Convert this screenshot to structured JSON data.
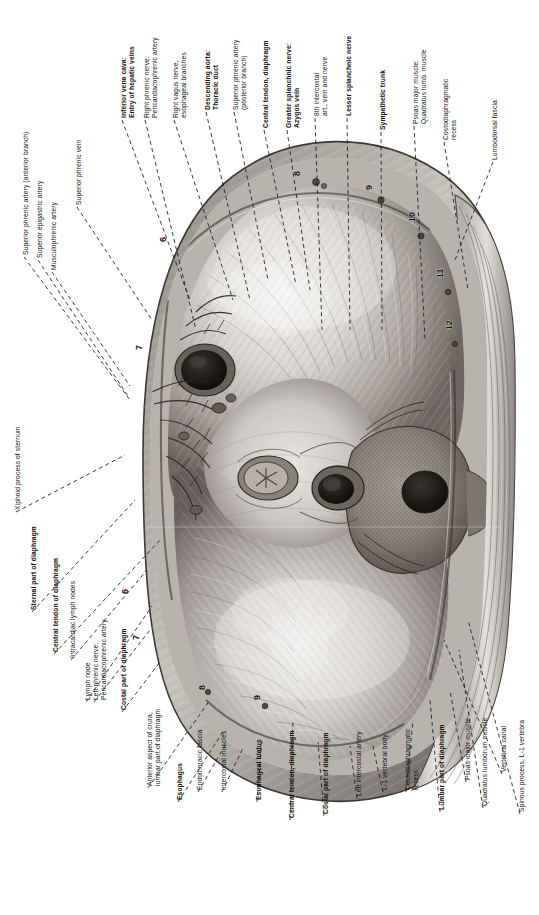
{
  "plate": {
    "title": "Diaphragm, inferior (abdominal) surface",
    "orientation": "rotated-90",
    "background_color": "#ffffff",
    "text_color": "#111111",
    "leader_line_color": "#1a1a1a"
  },
  "labels": {
    "top_row": [
      {
        "id": "inferior-vena-cava",
        "bold": true,
        "lines": [
          "Inferior vena cava:",
          "Entry of hepatic veins"
        ],
        "x": 120,
        "y": 118,
        "tip_x": 190,
        "tip_y": 300
      },
      {
        "id": "right-phrenic-nerve",
        "bold": false,
        "lines": [
          "Right phrenic nerve:",
          "Pericardiacophrenic artery"
        ],
        "x": 143,
        "y": 118,
        "tip_x": 196,
        "tip_y": 330
      },
      {
        "id": "right-vagus-nerve",
        "bold": false,
        "lines": [
          "Right vagus nerve,",
          "esophageal branches"
        ],
        "x": 172,
        "y": 118,
        "tip_x": 233,
        "tip_y": 300
      },
      {
        "id": "descending-aorta",
        "bold": true,
        "lines": [
          "Descending aorta:",
          "Thoracic duct"
        ],
        "x": 204,
        "y": 110,
        "tip_x": 250,
        "tip_y": 300
      },
      {
        "id": "superior-phrenic-artery",
        "bold": false,
        "lines": [
          "Superior phrenic artery",
          "(posterior branch)"
        ],
        "x": 232,
        "y": 110,
        "tip_x": 268,
        "tip_y": 280
      },
      {
        "id": "central-tendon-diaphragm-top",
        "bold": true,
        "lines": [
          "Central tendon, diaphragm"
        ],
        "x": 262,
        "y": 128,
        "tip_x": 296,
        "tip_y": 285
      },
      {
        "id": "greater-splanchnic-nerve",
        "bold": true,
        "lines": [
          "Greater splanchnic nerve:",
          "Azygos vein"
        ],
        "x": 285,
        "y": 128,
        "tip_x": 310,
        "tip_y": 290
      },
      {
        "id": "eighth-intercostal",
        "bold": false,
        "lines": [
          "8th intercostal",
          "art., vein and nerve"
        ],
        "x": 313,
        "y": 116,
        "tip_x": 322,
        "tip_y": 330
      },
      {
        "id": "lesser-splanchnic-nerve",
        "bold": true,
        "lines": [
          "Lesser splanchnic nerve"
        ],
        "x": 345,
        "y": 116,
        "tip_x": 350,
        "tip_y": 330
      },
      {
        "id": "sympathetic-trunk",
        "bold": true,
        "lines": [
          "Sympathetic trunk"
        ],
        "x": 379,
        "y": 130,
        "tip_x": 382,
        "tip_y": 330
      },
      {
        "id": "psoas-major-muscle-top",
        "bold": false,
        "lines": [
          "Psoas major muscle:",
          "Quadratus lumb. muscle"
        ],
        "x": 412,
        "y": 124,
        "tip_x": 425,
        "tip_y": 340
      },
      {
        "id": "costodiaphragmatic-recess-top",
        "bold": false,
        "lines": [
          "Costodiaphragmatic",
          "recess"
        ],
        "x": 442,
        "y": 140,
        "tip_x": 468,
        "tip_y": 290
      },
      {
        "id": "lumbodorsal-fascia",
        "bold": false,
        "lines": [
          "Lumbodorsal fascia"
        ],
        "x": 491,
        "y": 160,
        "tip_x": 455,
        "tip_y": 260
      }
    ],
    "left_column": [
      {
        "id": "superior-phrenic-artery-anterior",
        "bold": false,
        "lines": [
          "Superior phrenic artery (anterior branch)"
        ],
        "x": 22,
        "y": 255,
        "tip_x": 130,
        "tip_y": 400
      },
      {
        "id": "superior-epigastric-artery",
        "bold": false,
        "lines": [
          "Superior epigastric artery"
        ],
        "x": 36,
        "y": 258,
        "tip_x": 128,
        "tip_y": 396
      },
      {
        "id": "musculophrenic-artery",
        "bold": false,
        "lines": [
          "Musculophrenic artery"
        ],
        "x": 50,
        "y": 270,
        "tip_x": 130,
        "tip_y": 386
      },
      {
        "id": "superior-phrenic-vein",
        "bold": false,
        "lines": [
          "Superior phrenic vein"
        ],
        "x": 75,
        "y": 205,
        "tip_x": 152,
        "tip_y": 320
      },
      {
        "id": "xiphoid-process-of-sternum",
        "bold": false,
        "lines": [
          "Xiphoid process of sternum"
        ],
        "x": 14,
        "y": 510,
        "tip_x": 125,
        "tip_y": 455
      },
      {
        "id": "sternal-part-of-diaphragm",
        "bold": true,
        "lines": [
          "Sternal part of diaphragm"
        ],
        "x": 30,
        "y": 610,
        "tip_x": 135,
        "tip_y": 500
      },
      {
        "id": "central-tendon-of-diaphragm",
        "bold": true,
        "lines": [
          "Central tendon of diaphragm"
        ],
        "x": 52,
        "y": 652,
        "tip_x": 160,
        "tip_y": 540
      },
      {
        "id": "intracardiac-lymph-nodes",
        "bold": false,
        "lines": [
          "Intracardiac lymph nodes"
        ],
        "x": 69,
        "y": 658,
        "tip_x": 147,
        "tip_y": 570
      },
      {
        "id": "lymph-node",
        "bold": false,
        "lines": [
          "Lymph node"
        ],
        "x": 84,
        "y": 700,
        "tip_x": 152,
        "tip_y": 606
      },
      {
        "id": "left-phrenic-nerve",
        "bold": false,
        "lines": [
          "Left phrenic nerve:",
          "Pericardiacophrenic artery"
        ],
        "x": 92,
        "y": 700,
        "tip_x": 150,
        "tip_y": 630
      },
      {
        "id": "costal-part-of-diaphragm-left",
        "bold": true,
        "lines": [
          "Costal part of diaphragm"
        ],
        "x": 120,
        "y": 710,
        "tip_x": 160,
        "tip_y": 662
      }
    ],
    "bottom_row": [
      {
        "id": "anterior-aspect-of-crura",
        "bold": false,
        "lines": [
          "Anterior aspect of crura,",
          "lumbar part of diaphragm"
        ],
        "x": 146,
        "y": 786,
        "tip_x": 210,
        "tip_y": 700
      },
      {
        "id": "esophagus",
        "bold": true,
        "lines": [
          "Esophagus"
        ],
        "x": 176,
        "y": 800,
        "tip_x": 224,
        "tip_y": 730
      },
      {
        "id": "endothoracic-fascia",
        "bold": false,
        "lines": [
          "Endothoracic fascia"
        ],
        "x": 196,
        "y": 790,
        "tip_x": 227,
        "tip_y": 742
      },
      {
        "id": "intercostal-muscles",
        "bold": false,
        "lines": [
          "Intercostal muscles"
        ],
        "x": 220,
        "y": 790,
        "tip_x": 243,
        "tip_y": 748
      },
      {
        "id": "esophageal-hiatus",
        "bold": true,
        "lines": [
          "Esophageal hiatus"
        ],
        "x": 255,
        "y": 800,
        "tip_x": 262,
        "tip_y": 738
      },
      {
        "id": "central-tendon-diaphragm-bottom",
        "bold": true,
        "lines": [
          "Central tendon, diaphragm"
        ],
        "x": 288,
        "y": 818,
        "tip_x": 293,
        "tip_y": 720
      },
      {
        "id": "costal-part-of-diaphragm-bottom",
        "bold": true,
        "lines": [
          "Costal part of diaphragm"
        ],
        "x": 322,
        "y": 814,
        "tip_x": 318,
        "tip_y": 742
      },
      {
        "id": "left-intercostal-artery",
        "bold": false,
        "lines": [
          "Left intercostal artery"
        ],
        "x": 355,
        "y": 796,
        "tip_x": 350,
        "tip_y": 746
      },
      {
        "id": "l1-vertebral-body",
        "bold": false,
        "lines": [
          "L-1 vertebral body"
        ],
        "x": 381,
        "y": 790,
        "tip_x": 372,
        "tip_y": 742
      },
      {
        "id": "costodiaphragmatic-recess-bottom",
        "bold": false,
        "lines": [
          "Costodiaphragmatic",
          "recess"
        ],
        "x": 404,
        "y": 790,
        "tip_x": 413,
        "tip_y": 720
      },
      {
        "id": "lumbar-part-of-diaphragm",
        "bold": true,
        "lines": [
          "Lumbar part of diaphragm"
        ],
        "x": 438,
        "y": 810,
        "tip_x": 430,
        "tip_y": 700
      },
      {
        "id": "psoas-major-muscle-bottom",
        "bold": false,
        "lines": [
          "Psoas major muscle"
        ],
        "x": 464,
        "y": 780,
        "tip_x": 450,
        "tip_y": 690
      },
      {
        "id": "quadratus-lumborum-muscle",
        "bold": false,
        "lines": [
          "Quadratus lumborum muscle"
        ],
        "x": 481,
        "y": 806,
        "tip_x": 459,
        "tip_y": 650
      },
      {
        "id": "vertebral-canal",
        "bold": false,
        "lines": [
          "Vertebral canal"
        ],
        "x": 500,
        "y": 772,
        "tip_x": 444,
        "tip_y": 640
      },
      {
        "id": "spinous-process-l1",
        "bold": false,
        "lines": [
          "Spinous process, L-1 vertebra"
        ],
        "x": 518,
        "y": 812,
        "tip_x": 468,
        "tip_y": 620
      }
    ]
  },
  "rib_markers": [
    {
      "id": "rib-6-upper-left",
      "number": "6",
      "x": 166,
      "y": 242
    },
    {
      "id": "rib-7-left",
      "number": "7",
      "x": 142,
      "y": 350
    },
    {
      "id": "rib-6-lower-left",
      "number": "6",
      "x": 128,
      "y": 594
    },
    {
      "id": "rib-7-lower-left",
      "number": "7",
      "x": 139,
      "y": 640
    },
    {
      "id": "rib-8-bottom",
      "number": "8",
      "x": 205,
      "y": 690
    },
    {
      "id": "rib-9-bottom",
      "number": "9",
      "x": 260,
      "y": 700
    },
    {
      "id": "rib-8-right-upper",
      "number": "8",
      "x": 300,
      "y": 176
    },
    {
      "id": "rib-9-right",
      "number": "9",
      "x": 372,
      "y": 190
    },
    {
      "id": "rib-10-right",
      "number": "10",
      "x": 415,
      "y": 222
    },
    {
      "id": "rib-11-right",
      "number": "11",
      "x": 443,
      "y": 278
    },
    {
      "id": "rib-12-right",
      "number": "12",
      "x": 452,
      "y": 330
    }
  ]
}
